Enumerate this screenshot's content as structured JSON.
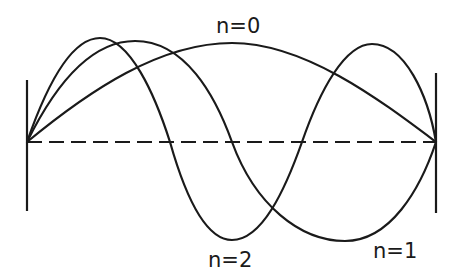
{
  "diagram": {
    "type": "standing-wave-modes",
    "walls": {
      "left": {
        "x": 27,
        "y_top": 80,
        "y_bottom": 211
      },
      "right": {
        "x": 436,
        "y_top": 73,
        "y_bottom": 213
      }
    },
    "axis": {
      "y": 142,
      "style": "dashed"
    },
    "line_color": "#1a1a1a",
    "background": "#ffffff",
    "modes": [
      {
        "n": 0,
        "label": "n=0",
        "antinodes": 1,
        "peak": {
          "x": 232,
          "y": 43
        }
      },
      {
        "n": 1,
        "label": "n=1",
        "antinodes": 2,
        "peak": {
          "x": 135,
          "y": 41
        },
        "trough": {
          "x": 345,
          "y": 241
        },
        "node_x": 232
      },
      {
        "n": 2,
        "label": "n=2",
        "antinodes": 3,
        "peaks": [
          {
            "x": 100,
            "y": 38
          },
          {
            "x": 372,
            "y": 44
          }
        ],
        "trough": {
          "x": 232,
          "y": 240
        },
        "node_x": [
          170,
          302
        ]
      }
    ]
  },
  "labels": {
    "n0": "n=0",
    "n1": "n=1",
    "n2": "n=2"
  }
}
